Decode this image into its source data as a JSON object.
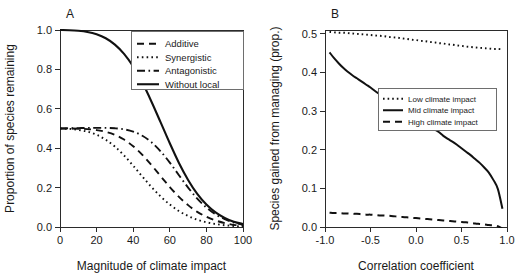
{
  "figure": {
    "width": 527,
    "height": 280,
    "background": "#ffffff",
    "line_color": "#111111"
  },
  "chart_data": [
    {
      "type": "line",
      "panel_label": "A",
      "title": "",
      "xlabel": "Magnitude of climate impact",
      "ylabel": "Proportion of species remaining",
      "xlim": [
        0,
        100
      ],
      "ylim": [
        0,
        1.0
      ],
      "xticks": [
        0,
        20,
        40,
        60,
        80,
        100
      ],
      "xticklabels": [
        "0",
        "20",
        "40",
        "60",
        "80",
        "100"
      ],
      "yticks": [
        0.0,
        0.2,
        0.4,
        0.6,
        0.8,
        1.0
      ],
      "yticklabels": [
        "0.0",
        "0.2",
        "0.4",
        "0.6",
        "0.8",
        "1.0"
      ],
      "grid": false,
      "legend_position": "top-right",
      "x": [
        0,
        5,
        10,
        15,
        20,
        25,
        30,
        35,
        40,
        45,
        50,
        55,
        60,
        65,
        70,
        75,
        80,
        85,
        90,
        95,
        100
      ],
      "series": [
        {
          "name": "Additive",
          "dash": "7,5",
          "width": 1.9,
          "values": [
            0.5,
            0.5,
            0.499,
            0.497,
            0.492,
            0.483,
            0.468,
            0.444,
            0.41,
            0.366,
            0.314,
            0.258,
            0.203,
            0.153,
            0.111,
            0.077,
            0.052,
            0.033,
            0.02,
            0.011,
            0.006
          ]
        },
        {
          "name": "Synergistic",
          "dash": "1.6,3.2",
          "width": 1.9,
          "values": [
            0.5,
            0.498,
            0.493,
            0.484,
            0.468,
            0.443,
            0.408,
            0.363,
            0.311,
            0.256,
            0.203,
            0.155,
            0.114,
            0.081,
            0.056,
            0.037,
            0.024,
            0.015,
            0.009,
            0.005,
            0.002
          ]
        },
        {
          "name": "Antagonistic",
          "dash": "8,3.5,1.6,3.5",
          "width": 1.9,
          "values": [
            0.5,
            0.501,
            0.502,
            0.503,
            0.503,
            0.503,
            0.501,
            0.496,
            0.484,
            0.463,
            0.43,
            0.384,
            0.327,
            0.263,
            0.2,
            0.144,
            0.099,
            0.064,
            0.04,
            0.023,
            0.012
          ]
        },
        {
          "name": "Without local",
          "dash": "",
          "width": 2.1,
          "values": [
            1.0,
            0.999,
            0.996,
            0.99,
            0.978,
            0.958,
            0.926,
            0.879,
            0.815,
            0.733,
            0.636,
            0.531,
            0.425,
            0.325,
            0.239,
            0.168,
            0.114,
            0.074,
            0.046,
            0.027,
            0.015
          ]
        }
      ],
      "legend_entries": [
        {
          "label": "Additive",
          "dash": "7,5",
          "width": 1.9
        },
        {
          "label": "Synergistic",
          "dash": "1.6,3.2",
          "width": 1.9
        },
        {
          "label": "Antagonistic",
          "dash": "8,3.5,1.6,3.5",
          "width": 1.9
        },
        {
          "label": "Without local",
          "dash": "",
          "width": 2.1
        }
      ]
    },
    {
      "type": "line",
      "panel_label": "B",
      "title": "",
      "xlabel": "Correlation coefficient",
      "ylabel": "Species gained from managing (prop.)",
      "xlim": [
        -1.0,
        1.0
      ],
      "ylim": [
        0.0,
        0.51
      ],
      "xticks": [
        -1.0,
        -0.5,
        0.0,
        0.5,
        1.0
      ],
      "xticklabels": [
        "-1.0",
        "-0.5",
        "0.0",
        "0.5",
        "1.0"
      ],
      "yticks": [
        0.0,
        0.1,
        0.2,
        0.3,
        0.4,
        0.5
      ],
      "yticklabels": [
        "0.0",
        "0.1",
        "0.2",
        "0.3",
        "0.4",
        "0.5"
      ],
      "grid": false,
      "legend_position": "middle-right",
      "x": [
        -0.95,
        -0.9,
        -0.85,
        -0.8,
        -0.75,
        -0.7,
        -0.65,
        -0.6,
        -0.55,
        -0.5,
        -0.45,
        -0.4,
        -0.35,
        -0.3,
        -0.25,
        -0.2,
        -0.15,
        -0.1,
        -0.05,
        0.0,
        0.05,
        0.1,
        0.15,
        0.2,
        0.25,
        0.3,
        0.35,
        0.4,
        0.45,
        0.5,
        0.55,
        0.6,
        0.65,
        0.7,
        0.75,
        0.8,
        0.85,
        0.9,
        0.95
      ],
      "series": [
        {
          "name": "Low climate impact",
          "dash": "1.6,3.0",
          "width": 1.9,
          "values": [
            0.505,
            0.504,
            0.503,
            0.503,
            0.502,
            0.501,
            0.5,
            0.499,
            0.498,
            0.497,
            0.496,
            0.495,
            0.494,
            0.492,
            0.491,
            0.49,
            0.488,
            0.487,
            0.485,
            0.484,
            0.482,
            0.481,
            0.479,
            0.478,
            0.476,
            0.475,
            0.473,
            0.472,
            0.47,
            0.469,
            0.467,
            0.466,
            0.465,
            0.464,
            0.463,
            0.462,
            0.461,
            0.461,
            0.46
          ]
        },
        {
          "name": "Mid climate impact",
          "dash": "",
          "width": 2.0,
          "values": [
            0.452,
            0.437,
            0.424,
            0.412,
            0.402,
            0.393,
            0.385,
            0.377,
            0.369,
            0.361,
            0.352,
            0.344,
            0.336,
            0.328,
            0.32,
            0.312,
            0.302,
            0.293,
            0.286,
            0.279,
            0.272,
            0.265,
            0.258,
            0.253,
            0.246,
            0.236,
            0.228,
            0.221,
            0.213,
            0.204,
            0.195,
            0.186,
            0.176,
            0.166,
            0.154,
            0.141,
            0.122,
            0.098,
            0.047
          ]
        },
        {
          "name": "High climate impact",
          "dash": "7,5",
          "width": 2.0,
          "values": [
            0.037,
            0.036,
            0.036,
            0.035,
            0.035,
            0.034,
            0.034,
            0.033,
            0.032,
            0.032,
            0.031,
            0.03,
            0.03,
            0.029,
            0.028,
            0.027,
            0.026,
            0.025,
            0.024,
            0.023,
            0.022,
            0.021,
            0.02,
            0.019,
            0.018,
            0.017,
            0.016,
            0.015,
            0.014,
            0.013,
            0.012,
            0.011,
            0.009,
            0.008,
            0.007,
            0.005,
            0.004,
            0.002,
            -0.004
          ]
        }
      ],
      "legend_entries": [
        {
          "label": "Low climate impact",
          "dash": "1.6,3.0",
          "width": 1.9
        },
        {
          "label": "Mid climate impact",
          "dash": "",
          "width": 2.0
        },
        {
          "label": "High climate impact",
          "dash": "7,5",
          "width": 2.0
        }
      ]
    }
  ]
}
